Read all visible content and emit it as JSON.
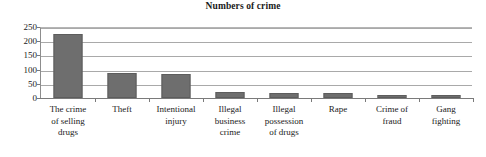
{
  "chart_data": {
    "type": "bar",
    "title": "Numbers of crime",
    "xlabel": "",
    "ylabel": "",
    "ylim": [
      0,
      250
    ],
    "yticks": [
      0,
      50,
      100,
      150,
      200,
      250
    ],
    "grid": true,
    "legend": "none",
    "bar_color": "#6e6e6e",
    "categories": [
      "The crime of selling drugs",
      "Theft",
      "Intentional injury",
      "Illegal business crime",
      "Illegal possession of drugs",
      "Rape",
      "Crime of fraud",
      "Gang fighting"
    ],
    "category_lines": [
      [
        "The crime",
        "of selling",
        "drugs"
      ],
      [
        "Theft"
      ],
      [
        "Intentional",
        "injury"
      ],
      [
        "Illegal",
        "business",
        "crime"
      ],
      [
        "Illegal",
        "possession",
        "of drugs"
      ],
      [
        "Rape"
      ],
      [
        "Crime of",
        "fraud"
      ],
      [
        "Gang",
        "fighting"
      ]
    ],
    "values": [
      225,
      88,
      86,
      22,
      18,
      18,
      12,
      10
    ]
  }
}
